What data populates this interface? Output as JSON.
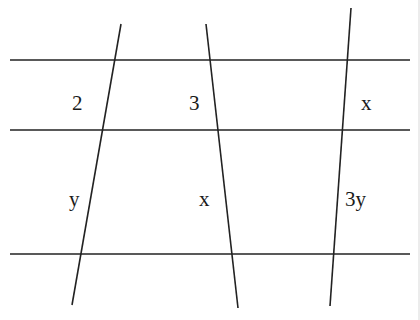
{
  "diagram": {
    "line_color": "#222222",
    "horizontal_lines": [
      {
        "y": 60,
        "x1": 10,
        "x2": 410
      },
      {
        "y": 130,
        "x1": 10,
        "x2": 410
      },
      {
        "y": 254,
        "x1": 10,
        "x2": 410
      }
    ],
    "transversals": [
      {
        "x1": 121,
        "y1": 24,
        "x2": 72,
        "y2": 305
      },
      {
        "x1": 206,
        "y1": 24,
        "x2": 238,
        "y2": 308
      },
      {
        "x1": 351,
        "y1": 8,
        "x2": 330,
        "y2": 306
      }
    ],
    "labels": [
      {
        "id": "label-2",
        "text": "2",
        "x": 72,
        "y": 110
      },
      {
        "id": "label-3",
        "text": "3",
        "x": 189,
        "y": 110
      },
      {
        "id": "label-x-top",
        "text": "x",
        "x": 361,
        "y": 110
      },
      {
        "id": "label-y",
        "text": "y",
        "x": 69,
        "y": 206
      },
      {
        "id": "label-x-bottom",
        "text": "x",
        "x": 199,
        "y": 206
      },
      {
        "id": "label-3y",
        "text": "3y",
        "x": 345,
        "y": 206
      }
    ]
  }
}
